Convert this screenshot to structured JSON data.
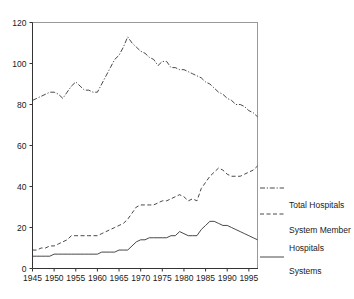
{
  "chart_data": {
    "type": "line",
    "title": "",
    "xlabel": "",
    "ylabel": "",
    "xlim": [
      1945,
      1997
    ],
    "ylim": [
      0,
      120
    ],
    "grid": false,
    "legend_position": "right",
    "xticks": [
      1945,
      1950,
      1955,
      1960,
      1965,
      1970,
      1975,
      1980,
      1985,
      1990,
      1995
    ],
    "yticks": [
      0,
      20,
      40,
      60,
      80,
      100,
      120
    ],
    "x": [
      1945,
      1946,
      1947,
      1948,
      1949,
      1950,
      1951,
      1952,
      1953,
      1954,
      1955,
      1956,
      1957,
      1958,
      1959,
      1960,
      1961,
      1962,
      1963,
      1964,
      1965,
      1966,
      1967,
      1968,
      1969,
      1970,
      1971,
      1972,
      1973,
      1974,
      1975,
      1976,
      1977,
      1978,
      1979,
      1980,
      1981,
      1982,
      1983,
      1984,
      1985,
      1986,
      1987,
      1988,
      1989,
      1990,
      1991,
      1992,
      1993,
      1994,
      1995,
      1996,
      1997
    ],
    "series": [
      {
        "name": "Total Hospitals",
        "style": "dash-dot",
        "values": [
          82,
          83,
          84,
          85,
          86,
          86,
          85,
          83,
          86,
          89,
          91,
          89,
          87,
          87,
          86,
          86,
          90,
          94,
          98,
          102,
          104,
          108,
          113,
          110,
          108,
          106,
          105,
          103,
          102,
          99,
          101,
          101,
          98,
          98,
          97,
          97,
          96,
          95,
          94,
          93,
          91,
          90,
          88,
          86,
          85,
          83,
          82,
          80,
          80,
          79,
          77,
          76,
          74
        ]
      },
      {
        "name": "System Member Hospitals",
        "style": "dashed",
        "values": [
          9,
          9,
          10,
          10,
          11,
          11,
          12,
          13,
          14,
          16,
          16,
          16,
          16,
          16,
          16,
          16,
          17,
          18,
          19,
          20,
          21,
          22,
          24,
          27,
          30,
          31,
          31,
          31,
          31,
          32,
          33,
          33,
          34,
          35,
          36,
          35,
          33,
          34,
          33,
          39,
          42,
          45,
          47,
          49,
          48,
          46,
          45,
          45,
          45,
          46,
          47,
          48,
          50
        ]
      },
      {
        "name": "Systems",
        "style": "solid",
        "values": [
          6,
          6,
          6,
          6,
          6,
          7,
          7,
          7,
          7,
          7,
          7,
          7,
          7,
          7,
          7,
          7,
          8,
          8,
          8,
          8,
          9,
          9,
          9,
          11,
          13,
          14,
          14,
          15,
          15,
          15,
          15,
          15,
          16,
          16,
          18,
          17,
          16,
          16,
          16,
          19,
          21,
          23,
          23,
          22,
          21,
          21,
          20,
          19,
          18,
          17,
          16,
          15,
          14
        ]
      }
    ]
  },
  "legend": {
    "items": [
      {
        "label": "Total Hospitals",
        "style": "dash-dot"
      },
      {
        "label": "System Member",
        "style": "dashed"
      },
      {
        "label": "Hospitals",
        "style": "none"
      },
      {
        "label": "Systems",
        "style": "solid"
      }
    ]
  }
}
